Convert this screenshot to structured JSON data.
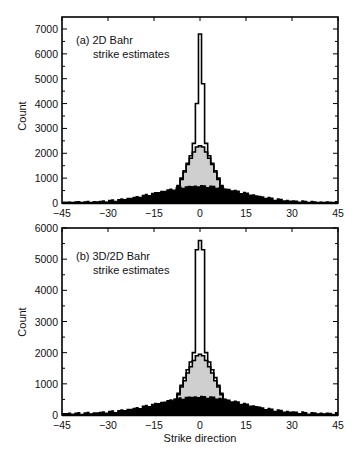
{
  "chart_data": [
    {
      "type": "bar",
      "title": "(a) 2D Bahr",
      "subtitle": "strike estimates",
      "xlabel": "",
      "ylabel": "Count",
      "xlim": [
        -45,
        45
      ],
      "ylim": [
        0,
        7000
      ],
      "xticks": [
        -45,
        -30,
        -15,
        0,
        15,
        30,
        45
      ],
      "yticks": [
        0,
        1000,
        2000,
        3000,
        4000,
        5000,
        6000,
        7000
      ],
      "grid": false,
      "bin_width": 1,
      "series": [
        {
          "name": "narrow (outline)",
          "style": "outline",
          "color": "#ffffff",
          "x": [
            -7,
            -6,
            -5,
            -4,
            -3,
            -2,
            -1,
            0,
            1,
            2,
            3,
            4,
            5,
            6,
            7
          ],
          "values": [
            700,
            1000,
            1300,
            1600,
            1900,
            2400,
            4000,
            6800,
            4800,
            2400,
            1900,
            1600,
            1300,
            1000,
            700
          ]
        },
        {
          "name": "intermediate (gray)",
          "style": "fill",
          "color": "#cccccc",
          "x": [
            -7,
            -6,
            -5,
            -4,
            -3,
            -2,
            -1,
            0,
            1,
            2,
            3,
            4,
            5,
            6,
            7
          ],
          "values": [
            650,
            950,
            1250,
            1550,
            1800,
            2050,
            2250,
            2300,
            2250,
            2050,
            1800,
            1550,
            1250,
            950,
            650
          ]
        },
        {
          "name": "broad (black)",
          "style": "fill",
          "color": "#000000",
          "x_range": [
            -45,
            45
          ],
          "peak": 700,
          "peak_x": 0,
          "tail_value": 40
        }
      ]
    },
    {
      "type": "bar",
      "title": "(b) 3D/2D Bahr",
      "subtitle": "strike estimates",
      "xlabel": "Strike direction",
      "ylabel": "Count",
      "xlim": [
        -45,
        45
      ],
      "ylim": [
        0,
        6000
      ],
      "xticks": [
        -45,
        -30,
        -15,
        0,
        15,
        30,
        45
      ],
      "yticks": [
        0,
        1000,
        2000,
        3000,
        4000,
        5000,
        6000
      ],
      "grid": false,
      "bin_width": 1,
      "series": [
        {
          "name": "narrow (outline)",
          "style": "outline",
          "color": "#ffffff",
          "x": [
            -8,
            -7,
            -6,
            -5,
            -4,
            -3,
            -2,
            -1,
            0,
            1,
            2,
            3,
            4,
            5,
            6,
            7,
            8
          ],
          "values": [
            500,
            700,
            950,
            1200,
            1450,
            1700,
            2000,
            5300,
            5600,
            5300,
            2000,
            1700,
            1450,
            1200,
            950,
            700,
            500
          ]
        },
        {
          "name": "intermediate (gray)",
          "style": "fill",
          "color": "#cccccc",
          "x": [
            -8,
            -7,
            -6,
            -5,
            -4,
            -3,
            -2,
            -1,
            0,
            1,
            2,
            3,
            4,
            5,
            6,
            7,
            8
          ],
          "values": [
            450,
            650,
            900,
            1100,
            1350,
            1550,
            1750,
            1900,
            1950,
            1900,
            1750,
            1550,
            1350,
            1100,
            900,
            650,
            450
          ]
        },
        {
          "name": "broad (black)",
          "style": "fill",
          "color": "#000000",
          "x_range": [
            -45,
            45
          ],
          "peak": 600,
          "peak_x": 0,
          "tail_value": 60
        }
      ]
    }
  ],
  "panels": [
    {
      "label_line1": "(a) 2D Bahr",
      "label_line2": "strike estimates",
      "ylabel": "Count",
      "yticks": [
        "0",
        "1000",
        "2000",
        "3000",
        "4000",
        "5000",
        "6000",
        "7000"
      ],
      "xticks": [
        "-45",
        "-30",
        "-15",
        "0",
        "15",
        "30",
        "45"
      ]
    },
    {
      "label_line1": "(b) 3D/2D Bahr",
      "label_line2": "strike estimates",
      "ylabel": "Count",
      "yticks": [
        "0",
        "1000",
        "2000",
        "3000",
        "4000",
        "5000",
        "6000"
      ],
      "xticks": [
        "-45",
        "-30",
        "-15",
        "0",
        "15",
        "30",
        "45"
      ],
      "xlabel": "Strike direction"
    }
  ]
}
